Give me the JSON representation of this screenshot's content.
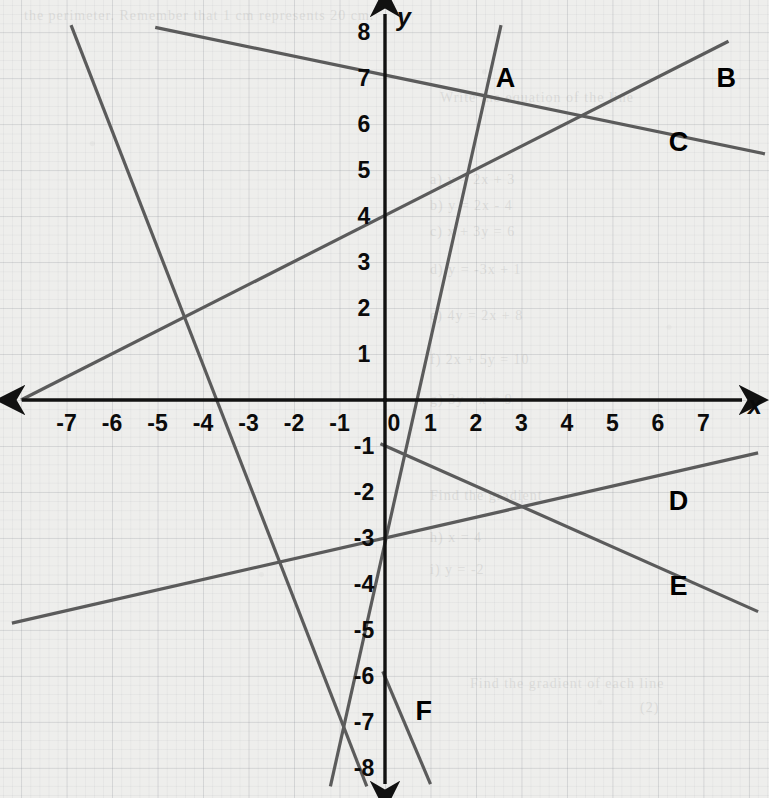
{
  "page": {
    "width": 769,
    "height": 798,
    "background_color": "#eeeeec",
    "ink_color": "#5b5b5b",
    "axis_color": "#111111",
    "grid_color": "#787d87"
  },
  "axes": {
    "x_axis_label": "x",
    "y_axis_label": "y",
    "origin_label": "0",
    "origin_px": {
      "x": 385,
      "y": 400
    },
    "unit_px": {
      "x": 45.5,
      "y": 46
    },
    "x_range": [
      -8.5,
      8.4
    ],
    "y_range": [
      -8.6,
      8.6
    ],
    "x_tick_labels": [
      "-7",
      "-6",
      "-5",
      "-4",
      "-3",
      "-2",
      "-1",
      "0",
      "1",
      "2",
      "3",
      "4",
      "5",
      "6",
      "7"
    ],
    "x_tick_values": [
      -7,
      -6,
      -5,
      -4,
      -3,
      -2,
      -1,
      0,
      1,
      2,
      3,
      4,
      5,
      6,
      7
    ],
    "y_tick_labels": [
      "8",
      "7",
      "6",
      "5",
      "4",
      "3",
      "2",
      "1",
      "-1",
      "-2",
      "-3",
      "-4",
      "-5",
      "-6",
      "-7",
      "-8"
    ],
    "y_tick_values": [
      8,
      7,
      6,
      5,
      4,
      3,
      2,
      1,
      -1,
      -2,
      -3,
      -4,
      -5,
      -6,
      -7,
      -8
    ],
    "arrowheads": [
      "left",
      "right",
      "up",
      "down"
    ],
    "grid": "on"
  },
  "chart_data": {
    "type": "line",
    "title": "",
    "xlabel": "x",
    "ylabel": "y",
    "xlim": [
      -8.5,
      8.4
    ],
    "ylim": [
      -8.6,
      8.6
    ],
    "grid": true,
    "legend": "inline-labels",
    "series": [
      {
        "name": "A",
        "label": "A",
        "label_at": {
          "x": 2.65,
          "y": 7.0
        },
        "slope": 4.5,
        "intercept": -1.0,
        "equation": "y = 4.5x - 1",
        "x_intercept": 0.22,
        "endpoints": [
          {
            "x": 2.55,
            "y": 8.15
          },
          {
            "x": -1.2,
            "y": -8.4
          }
        ],
        "points": [
          {
            "x": 2.55,
            "y": 8.15
          },
          {
            "x": -1.2,
            "y": -8.4
          }
        ]
      },
      {
        "name": "B",
        "label": "B",
        "label_at": {
          "x": 7.5,
          "y": 7.0
        },
        "slope": 0.5,
        "intercept": 4.0,
        "equation": "y = 0.5x + 4",
        "x_intercept": -8.0,
        "endpoints": [
          {
            "x": -8.0,
            "y": 0.0
          },
          {
            "x": 7.55,
            "y": 7.8
          }
        ],
        "points": [
          {
            "x": -8.0,
            "y": 0.0
          },
          {
            "x": 7.55,
            "y": 7.8
          }
        ]
      },
      {
        "name": "C",
        "label": "C",
        "label_at": {
          "x": 6.45,
          "y": 5.6
        },
        "slope": -0.2,
        "intercept": 7.0,
        "equation": "y = -0.2x + 7",
        "x_intercept": 35.0,
        "endpoints": [
          {
            "x": -5.05,
            "y": 8.1
          },
          {
            "x": 8.35,
            "y": 5.35
          }
        ],
        "points": [
          {
            "x": -5.05,
            "y": 8.1
          },
          {
            "x": 8.35,
            "y": 5.35
          }
        ]
      },
      {
        "name": "D",
        "label": "D",
        "label_at": {
          "x": 6.45,
          "y": -2.2
        },
        "slope": 0.225,
        "intercept": -3.0,
        "equation": "y = 0.225x - 3",
        "x_intercept": 13.3,
        "endpoints": [
          {
            "x": -8.2,
            "y": -4.85
          },
          {
            "x": 8.2,
            "y": -1.15
          }
        ],
        "points": [
          {
            "x": -8.2,
            "y": -4.85
          },
          {
            "x": 8.2,
            "y": -1.15
          }
        ]
      },
      {
        "name": "E",
        "label": "E",
        "label_at": {
          "x": 6.45,
          "y": -4.05
        },
        "slope": -0.44,
        "intercept": -1.0,
        "equation": "y = -0.44x - 1",
        "x_intercept": -2.27,
        "endpoints": [
          {
            "x": -0.1,
            "y": -0.95
          },
          {
            "x": 8.2,
            "y": -4.6
          }
        ],
        "points": [
          {
            "x": -0.1,
            "y": -0.95
          },
          {
            "x": 8.2,
            "y": -4.6
          }
        ]
      },
      {
        "name": "F",
        "label": "F",
        "label_at": {
          "x": 0.85,
          "y": -6.75
        },
        "slope": -2.5,
        "intercept": -7.5,
        "equation": "y = -2.5x - 7.5",
        "x_intercept": -3.0,
        "endpoints": [
          {
            "x": -6.9,
            "y": 8.15
          },
          {
            "x": -0.4,
            "y": -8.4
          }
        ],
        "points": [
          {
            "x": -6.9,
            "y": 8.15
          },
          {
            "x": -0.4,
            "y": -8.4
          }
        ]
      },
      {
        "name": "G",
        "label": "",
        "label_at": null,
        "slope": -2.3,
        "intercept": -6.0,
        "equation": "y = -2.3x - 6",
        "x_intercept": -2.6,
        "endpoints": [
          {
            "x": -0.05,
            "y": -5.9
          },
          {
            "x": 1.0,
            "y": -8.35
          }
        ],
        "points": [
          {
            "x": -0.05,
            "y": -5.9
          },
          {
            "x": 1.0,
            "y": -8.35
          }
        ]
      }
    ],
    "notable_intersections": [
      {
        "x": -4.0,
        "y": 2.0,
        "lines": [
          "B",
          "F",
          "D-extension"
        ]
      },
      {
        "x": 2.2,
        "y": 7.0,
        "lines": [
          "A",
          "C"
        ]
      },
      {
        "x": 4.5,
        "y": 6.1,
        "lines": [
          "B",
          "C"
        ]
      },
      {
        "x": 4.0,
        "y": -2.1,
        "lines": [
          "D",
          "E"
        ]
      },
      {
        "x": -3.0,
        "y": 0.0,
        "lines": [
          "F"
        ]
      }
    ]
  },
  "ghost_text": [
    {
      "text": "the perimeter. Remember that 1 cm represents 20 cm.",
      "x": 24,
      "y": 8
    },
    {
      "text": "Write the equation of the line",
      "x": 440,
      "y": 90
    },
    {
      "text": "a)  y = 2x + 3",
      "x": 430,
      "y": 172
    },
    {
      "text": "b)  y = 2x - 4",
      "x": 430,
      "y": 198
    },
    {
      "text": "c)  x + 3y = 6",
      "x": 430,
      "y": 224
    },
    {
      "text": "d)  y = -3x + 1",
      "x": 430,
      "y": 262
    },
    {
      "text": "e)  4y = 2x + 8",
      "x": 430,
      "y": 308
    },
    {
      "text": "f)  2x + 5y = 10",
      "x": 430,
      "y": 352
    },
    {
      "text": "g)  3y - x = 9",
      "x": 430,
      "y": 392
    },
    {
      "text": "Find the gradient",
      "x": 430,
      "y": 488
    },
    {
      "text": "h)  x = 4",
      "x": 430,
      "y": 530
    },
    {
      "text": "i)  y = -2",
      "x": 430,
      "y": 562
    },
    {
      "text": "Find the gradient of each line",
      "x": 470,
      "y": 676
    },
    {
      "text": "(2)",
      "x": 640,
      "y": 700
    }
  ]
}
